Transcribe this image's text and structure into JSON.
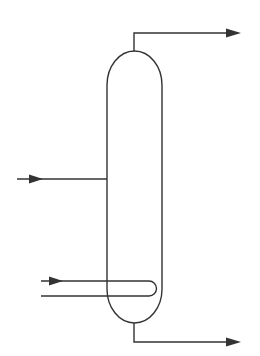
{
  "diagram": {
    "type": "distillation-column-schematic",
    "stroke_color": "#333333",
    "background": "#ffffff",
    "elements": [
      {
        "id": "column",
        "label": "",
        "kind": "vessel"
      },
      {
        "id": "feed-stream",
        "label": "",
        "kind": "inlet-arrow"
      },
      {
        "id": "overhead-stream",
        "label": "",
        "kind": "outlet-arrow"
      },
      {
        "id": "bottoms-stream",
        "label": "",
        "kind": "outlet-arrow"
      },
      {
        "id": "reboiler-coil",
        "label": "",
        "kind": "internal-heating-loop"
      }
    ]
  }
}
